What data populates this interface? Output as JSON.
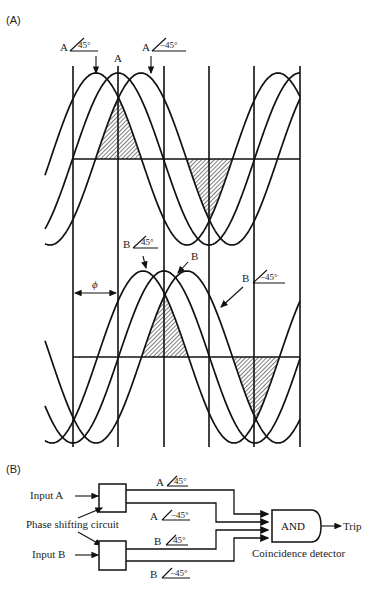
{
  "figure": {
    "panel_a_label": "(A)",
    "panel_b_label": "(B)",
    "colors": {
      "line": "#111111",
      "background": "#ffffff",
      "wire_green": "#2e6b2e",
      "wire_red": "#7a2a2a",
      "axis_blue": "#2b3a8a"
    }
  },
  "panel_a": {
    "top_plot": {
      "labels": [
        {
          "id": "a-plus45",
          "text": "A",
          "angle": "45°",
          "x": 66,
          "y": 52
        },
        {
          "id": "a-ref",
          "text": "A",
          "x": 114,
          "y": 63
        },
        {
          "id": "a-minus45",
          "text": "A",
          "angle": "−45°",
          "x": 143,
          "y": 52
        }
      ]
    },
    "bottom_plot": {
      "labels": [
        {
          "id": "b-plus45",
          "text": "B",
          "angle": "45°",
          "x": 93,
          "y": 253
        },
        {
          "id": "b-ref",
          "text": "B",
          "x": 190,
          "y": 262
        },
        {
          "id": "b-minus45",
          "text": "B",
          "angle": "−45°",
          "x": 243,
          "y": 283
        }
      ],
      "phi_label": "ϕ"
    }
  },
  "panel_b": {
    "input_a": "Input A",
    "input_b": "Input B",
    "phase_shifting_circuit": "Phase shifting circuit",
    "signals": [
      {
        "id": "a-plus45",
        "text": "A",
        "angle": "45°"
      },
      {
        "id": "a-minus45",
        "text": "A",
        "angle": "−45°"
      },
      {
        "id": "b-plus45",
        "text": "B",
        "angle": "45°"
      },
      {
        "id": "b-minus45",
        "text": "B",
        "angle": "−45°"
      }
    ],
    "gate_label": "AND",
    "gate_caption": "Coincidence detector",
    "output_label": "Trip"
  }
}
